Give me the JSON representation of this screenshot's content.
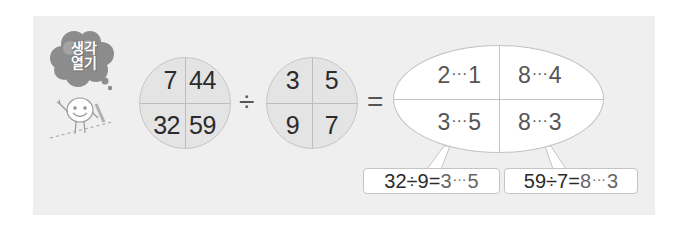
{
  "badge": {
    "line1": "생각",
    "line2": "열기",
    "icon": "thought-cloud-icon",
    "mascot": "smiling-character-icon"
  },
  "colors": {
    "panel_bg": "#efefef",
    "circle_fill": "#e4e4e4",
    "line": "#c2c2c2",
    "text_dark": "#2b2b2b",
    "text_answer": "#555555",
    "cloud": "#8a8a8a"
  },
  "equation": {
    "dividends": {
      "top_left": "7",
      "top_right": "44",
      "bottom_left": "32",
      "bottom_right": "59"
    },
    "divide_operator": "÷",
    "divisors": {
      "top_left": "3",
      "top_right": "5",
      "bottom_left": "9",
      "bottom_right": "7"
    },
    "equals_operator": "=",
    "results": {
      "top_left": {
        "quotient": "2",
        "sep": "···",
        "remainder": "1"
      },
      "top_right": {
        "quotient": "8",
        "sep": "···",
        "remainder": "4"
      },
      "bottom_left": {
        "quotient": "3",
        "sep": "···",
        "remainder": "5"
      },
      "bottom_right": {
        "quotient": "8",
        "sep": "···",
        "remainder": "3"
      }
    }
  },
  "callouts": [
    {
      "expression": "32÷9=",
      "quotient": "3",
      "sep": "···",
      "remainder": "5"
    },
    {
      "expression": "59÷7=",
      "quotient": "8",
      "sep": "···",
      "remainder": "3"
    }
  ]
}
